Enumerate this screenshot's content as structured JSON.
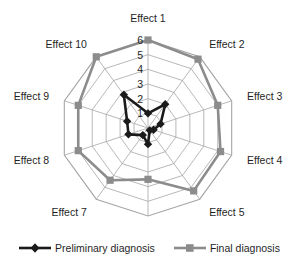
{
  "chart_data": {
    "type": "radar",
    "title": "",
    "categories": [
      "Effect 1",
      "Effect 2",
      "Effect 3",
      "Effect 4",
      "Effect 5",
      "Effect 6",
      "Effect 7",
      "Effect 8",
      "Effect 9",
      "Effect 10"
    ],
    "tick_labels": [
      "1",
      "2",
      "3",
      "4",
      "5",
      "6"
    ],
    "rlim": [
      0,
      6
    ],
    "grid": true,
    "legend_position": "bottom",
    "series": [
      {
        "name": "Preliminary diagnosis",
        "color": "#1a1a1a",
        "marker": "diamond",
        "values": [
          1.0,
          2.0,
          0.9,
          0.4,
          0.2,
          1.1,
          0.6,
          1.4,
          1.5,
          2.8
        ]
      },
      {
        "name": "Final diagnosis",
        "color": "#8c8c8c",
        "marker": "square",
        "values": [
          6.0,
          5.8,
          5.0,
          5.2,
          5.3,
          3.5,
          4.4,
          5.0,
          5.0,
          6.0
        ]
      }
    ]
  },
  "legend": {
    "items": [
      {
        "label": "Preliminary diagnosis",
        "color": "#1a1a1a",
        "marker": "diamond"
      },
      {
        "label": "Final diagnosis",
        "color": "#8c8c8c",
        "marker": "square"
      }
    ]
  },
  "colors": {
    "preliminary": "#1a1a1a",
    "final": "#8c8c8c",
    "grid": "#a6a6a6",
    "background": "#ffffff"
  }
}
